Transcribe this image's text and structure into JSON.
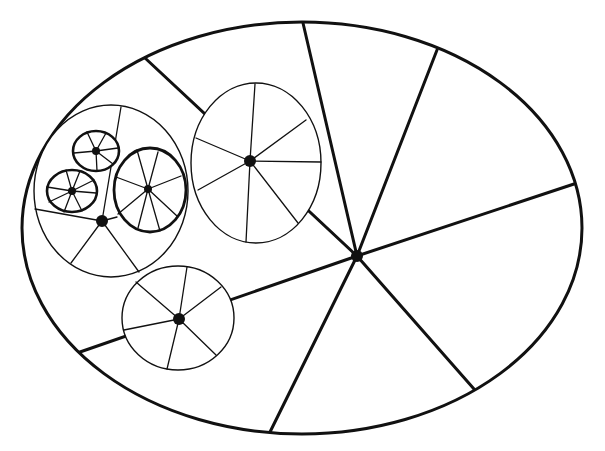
{
  "diagram": {
    "type": "nested-spoked-ellipses",
    "caption_cropped": "",
    "colors": {
      "stroke": "#111111",
      "hub": "#111111",
      "background": "#ffffff"
    },
    "outer": {
      "label": "outer-ellipse",
      "cx": 302,
      "cy": 228,
      "rx": 280,
      "ry": 206,
      "hub": {
        "x": 357,
        "y": 256,
        "r": 6
      },
      "spokes": [
        [
          303,
          23
        ],
        [
          437,
          50
        ],
        [
          574,
          184
        ],
        [
          474,
          389
        ],
        [
          270,
          432
        ],
        [
          80,
          352
        ],
        [
          145,
          58
        ]
      ],
      "stroke_width": 3
    },
    "groups": [
      {
        "label": "medium-cluster",
        "ellipse": {
          "cx": 111,
          "cy": 191,
          "rx": 77,
          "ry": 86,
          "sw": 1.4
        },
        "hub": {
          "x": 102,
          "y": 221,
          "r": 6
        },
        "spokes": [
          [
            121,
            107
          ],
          [
            35,
            209
          ],
          [
            71,
            263
          ],
          [
            139,
            272
          ],
          [
            117,
            217
          ]
        ]
      },
      {
        "label": "right-wheel",
        "ellipse": {
          "cx": 256,
          "cy": 163,
          "rx": 65,
          "ry": 80,
          "sw": 1.4
        },
        "hub": {
          "x": 250,
          "y": 161,
          "r": 6
        },
        "spokes": [
          [
            255,
            84
          ],
          [
            306,
            120
          ],
          [
            321,
            162
          ],
          [
            298,
            223
          ],
          [
            246,
            242
          ],
          [
            198,
            190
          ],
          [
            196,
            138
          ]
        ]
      },
      {
        "label": "bottom-wheel",
        "ellipse": {
          "cx": 178,
          "cy": 318,
          "rx": 56,
          "ry": 52,
          "sw": 1.4
        },
        "hub": {
          "x": 179,
          "y": 319,
          "r": 6
        },
        "spokes": [
          [
            187,
            267
          ],
          [
            221,
            287
          ],
          [
            216,
            355
          ],
          [
            167,
            369
          ],
          [
            124,
            330
          ],
          [
            136,
            282
          ]
        ]
      }
    ],
    "small_wheels": [
      {
        "label": "small-wheel-top",
        "ellipse": {
          "cx": 96,
          "cy": 151,
          "rx": 23,
          "ry": 20,
          "sw": 2.6
        },
        "hub": {
          "x": 96,
          "y": 151,
          "r": 4
        },
        "spokes": [
          [
            87,
            132
          ],
          [
            106,
            133
          ],
          [
            118,
            148
          ],
          [
            113,
            164
          ],
          [
            97,
            171
          ],
          [
            74,
            153
          ]
        ]
      },
      {
        "label": "small-wheel-left",
        "ellipse": {
          "cx": 72,
          "cy": 191,
          "rx": 25,
          "ry": 21,
          "sw": 2.6
        },
        "hub": {
          "x": 72,
          "y": 191,
          "r": 4
        },
        "spokes": [
          [
            66,
            170
          ],
          [
            80,
            171
          ],
          [
            94,
            180
          ],
          [
            96,
            193
          ],
          [
            82,
            211
          ],
          [
            64,
            212
          ],
          [
            49,
            202
          ],
          [
            47,
            187
          ]
        ]
      },
      {
        "label": "small-wheel-right",
        "ellipse": {
          "cx": 150,
          "cy": 190,
          "rx": 36,
          "ry": 42,
          "sw": 2.8
        },
        "hub": {
          "x": 148,
          "y": 189,
          "r": 4
        },
        "spokes": [
          [
            137,
            150
          ],
          [
            158,
            152
          ],
          [
            181,
            176
          ],
          [
            177,
            216
          ],
          [
            160,
            231
          ],
          [
            138,
            228
          ],
          [
            118,
            214
          ],
          [
            116,
            177
          ]
        ]
      }
    ]
  }
}
